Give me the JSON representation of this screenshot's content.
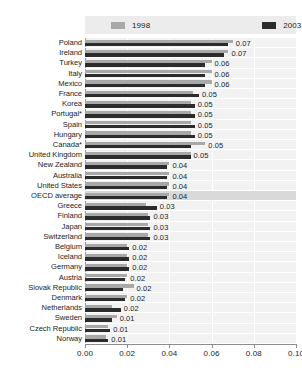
{
  "chart_data": {
    "type": "bar",
    "orientation": "horizontal",
    "title": "",
    "xlabel": "",
    "ylabel": "",
    "xlim": [
      0.0,
      0.1
    ],
    "xticks": [
      "0.00",
      "0.02",
      "0.04",
      "0.06",
      "0.08",
      "0.10"
    ],
    "xtick_values": [
      0.0,
      0.02,
      0.04,
      0.06,
      0.08,
      0.1
    ],
    "grid": true,
    "legend_position": "top",
    "categories": [
      "Poland",
      "Ireland",
      "Turkey",
      "Italy",
      "Mexico",
      "France",
      "Korea",
      "Portugal*",
      "Spain",
      "Hungary",
      "Canada*",
      "United Kingdom",
      "New Zealand",
      "Australia",
      "United States",
      "OECD average",
      "Greece",
      "Finland",
      "Japan",
      "Switzerland",
      "Belgium",
      "Iceland",
      "Germany",
      "Austria",
      "Slovak Republic",
      "Denmark",
      "Netherlands",
      "Sweden",
      "Czech Republic",
      "Norway"
    ],
    "highlight_category": "OECD average",
    "series": [
      {
        "name": "1998",
        "color": "#a8a8a8",
        "values": [
          0.07,
          0.068,
          0.06,
          0.06,
          0.06,
          0.051,
          0.05,
          0.05,
          0.05,
          0.05,
          0.057,
          0.05,
          0.04,
          0.04,
          0.04,
          0.04,
          0.029,
          0.03,
          0.03,
          0.03,
          0.02,
          0.02,
          0.02,
          0.02,
          0.023,
          0.02,
          0.013,
          0.015,
          0.011,
          0.01
        ]
      },
      {
        "name": "2003",
        "color": "#2c2c2c",
        "values": [
          0.068,
          0.066,
          0.057,
          0.057,
          0.057,
          0.054,
          0.052,
          0.052,
          0.052,
          0.052,
          0.05,
          0.05,
          0.039,
          0.039,
          0.039,
          0.039,
          0.034,
          0.031,
          0.031,
          0.031,
          0.021,
          0.021,
          0.021,
          0.019,
          0.018,
          0.019,
          0.017,
          0.013,
          0.012,
          0.011
        ]
      }
    ],
    "value_labels": [
      "0.07",
      "0.07",
      "0.06",
      "0.06",
      "0.06",
      "0.05",
      "0.05",
      "0.05",
      "0.05",
      "0.05",
      "0.05",
      "0.05",
      "0.04",
      "0.04",
      "0.04",
      "0.04",
      "0.03",
      "0.03",
      "0.03",
      "0.03",
      "0.02",
      "0.02",
      "0.02",
      "0.02",
      "0.02",
      "0.02",
      "0.02",
      "0.01",
      "0.01",
      "0.01"
    ]
  },
  "legend": {
    "entries": [
      {
        "label": "1998",
        "color": "#a8a8a8"
      },
      {
        "label": "2003",
        "color": "#2c2c2c"
      }
    ]
  }
}
